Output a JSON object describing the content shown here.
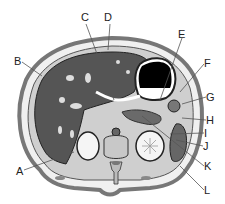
{
  "figure": {
    "type": "anatomical cross-section (axial abdomen)",
    "labels": [
      {
        "id": "A",
        "text": "A",
        "x": 16,
        "y": 166
      },
      {
        "id": "B",
        "text": "B",
        "x": 14,
        "y": 56
      },
      {
        "id": "C",
        "text": "C",
        "x": 81,
        "y": 12
      },
      {
        "id": "D",
        "text": "D",
        "x": 104,
        "y": 12
      },
      {
        "id": "E",
        "text": "E",
        "x": 178,
        "y": 29
      },
      {
        "id": "F",
        "text": "F",
        "x": 204,
        "y": 58
      },
      {
        "id": "G",
        "text": "G",
        "x": 206,
        "y": 92
      },
      {
        "id": "H",
        "text": "H",
        "x": 206,
        "y": 115
      },
      {
        "id": "I",
        "text": "I",
        "x": 204,
        "y": 128
      },
      {
        "id": "J",
        "text": "J",
        "x": 203,
        "y": 141
      },
      {
        "id": "K",
        "text": "K",
        "x": 204,
        "y": 161
      },
      {
        "id": "L",
        "text": "L",
        "x": 204,
        "y": 185
      }
    ]
  },
  "colors": {
    "body_outline": "#777777",
    "liver": "#555555",
    "organ_light": "#a8a8a8",
    "kidney": "#f5f5f5",
    "stomach_air": "#000000",
    "leader_line": "#555555"
  }
}
